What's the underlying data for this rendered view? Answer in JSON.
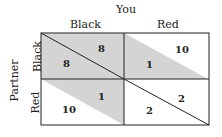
{
  "axes": {
    "column_player": "You",
    "row_player": "Partner",
    "columns": [
      "Black",
      "Red"
    ],
    "rows": [
      "Black",
      "Red"
    ]
  },
  "colors": {
    "shade": "#d4d4d4",
    "line": "#222222"
  },
  "cells": {
    "bb": {
      "partner": "8",
      "you": "8"
    },
    "br": {
      "partner": "1",
      "you": "10"
    },
    "rb": {
      "partner": "10",
      "you": "1"
    },
    "rr": {
      "partner": "2",
      "you": "2"
    }
  }
}
